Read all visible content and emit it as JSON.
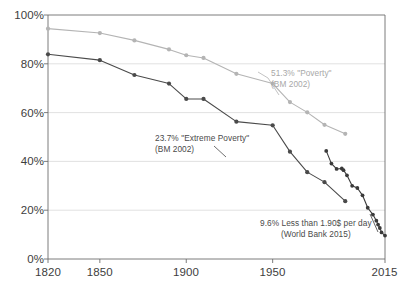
{
  "chart_data": {
    "type": "line",
    "title": "",
    "xlabel": "",
    "ylabel": "",
    "xlim": [
      1820,
      2015
    ],
    "ylim": [
      0,
      100
    ],
    "grid": true,
    "legend_position": "inline-annotations",
    "y_ticks": [
      "0%",
      "20%",
      "40%",
      "60%",
      "80%",
      "100%"
    ],
    "y_tick_values": [
      0,
      20,
      40,
      60,
      80,
      100
    ],
    "x_ticks": [
      "1820",
      "1850",
      "1900",
      "1950",
      "2015"
    ],
    "x_tick_values": [
      1820,
      1850,
      1900,
      1950,
      2015
    ],
    "series": [
      {
        "name": "\"Poverty\" (BM 2002)",
        "color": "#b4b4b4",
        "marker": "circle",
        "x": [
          1820,
          1850,
          1870,
          1890,
          1900,
          1910,
          1929,
          1950,
          1960,
          1970,
          1980,
          1992
        ],
        "values": [
          94.4,
          92.6,
          89.6,
          85.9,
          83.5,
          82.4,
          75.9,
          71.9,
          64.3,
          60.1,
          55.0,
          51.3
        ]
      },
      {
        "name": "\"Extreme Poverty\" (BM 2002)",
        "color": "#4a4a4a",
        "marker": "circle",
        "x": [
          1820,
          1850,
          1870,
          1890,
          1900,
          1910,
          1929,
          1950,
          1960,
          1970,
          1980,
          1992
        ],
        "values": [
          83.9,
          81.5,
          75.4,
          71.9,
          65.6,
          65.6,
          56.3,
          54.8,
          44.0,
          35.6,
          31.5,
          23.7
        ]
      },
      {
        "name": "Less than 1.90$ per day (World Bank 2015)",
        "color": "#3a3a3a",
        "marker": "circle",
        "x": [
          1981,
          1984,
          1987,
          1990,
          1991,
          1993,
          1996,
          1999,
          2002,
          2005,
          2008,
          2010,
          2011,
          2012,
          2013,
          2015
        ],
        "values": [
          44.3,
          39.1,
          36.9,
          37.1,
          36.4,
          34.3,
          30.0,
          29.1,
          26.1,
          21.0,
          18.2,
          15.7,
          14.1,
          12.7,
          10.9,
          9.6
        ]
      }
    ],
    "annotations": [
      {
        "id": "poverty-annotation",
        "line1": "51.3% \"Poverty\"",
        "line2": "(BM 2002)",
        "color": "#a8a8a8"
      },
      {
        "id": "extreme-poverty-annotation",
        "line1": "23.7% \"Extreme Poverty\"",
        "line2": "(BM 2002)",
        "color": "#4a4a4a"
      },
      {
        "id": "world-bank-annotation",
        "line1": "9.6% Less than 1.90$ per day",
        "line2": "(World Bank 2015)",
        "color": "#4a4a4a"
      }
    ]
  },
  "axes": {
    "y_tick_0": "0%",
    "y_tick_1": "20%",
    "y_tick_2": "40%",
    "y_tick_3": "60%",
    "y_tick_4": "80%",
    "y_tick_5": "100%",
    "x_tick_0": "1820",
    "x_tick_1": "1850",
    "x_tick_2": "1900",
    "x_tick_3": "1950",
    "x_tick_4": "2015"
  },
  "colors": {
    "poverty_line": "#b4b4b4",
    "extreme_poverty_line": "#4a4a4a",
    "world_bank_line": "#3a3a3a",
    "grid": "#d9d9d9",
    "axis": "#6e6e6e",
    "background": "#ffffff"
  }
}
